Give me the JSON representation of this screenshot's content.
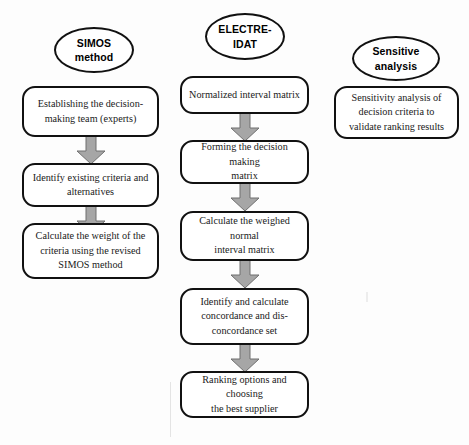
{
  "diagram": {
    "background_color": "#fdfdfd",
    "outline_color": "#111111",
    "arrow_fill_color": "#a6a6a6",
    "arrow_stroke_color": "#6f6f6f",
    "columns": [
      {
        "id": "simos",
        "header": {
          "name": "simos-method-ellipse",
          "line1": "SIMOS",
          "line2": "method"
        },
        "steps": [
          {
            "name": "establishing-team-box",
            "lines": [
              "Establishing the decision-",
              "making team (experts)"
            ]
          },
          {
            "name": "identify-criteria-box",
            "lines": [
              "Identify existing criteria and",
              "alternatives"
            ]
          },
          {
            "name": "calculate-weight-box",
            "lines": [
              "Calculate the weight of the",
              "criteria using the revised",
              "SIMOS method"
            ]
          }
        ]
      },
      {
        "id": "electre-idat",
        "header": {
          "name": "electre-idat-ellipse",
          "line1": "ELECTRE-",
          "line2": "IDAT"
        },
        "steps": [
          {
            "name": "normalized-interval-matrix-box",
            "lines": [
              "Normalized interval matrix"
            ]
          },
          {
            "name": "forming-decision-matrix-box",
            "lines": [
              "Forming the decision making",
              "matrix"
            ]
          },
          {
            "name": "weighed-normal-matrix-box",
            "lines": [
              "Calculate the weighed normal",
              "interval matrix"
            ]
          },
          {
            "name": "concordance-set-box",
            "lines": [
              "Identify and calculate",
              "concordance and dis-",
              "concordance set"
            ]
          },
          {
            "name": "ranking-options-box",
            "lines": [
              "Ranking options and choosing",
              "the best supplier"
            ]
          }
        ]
      },
      {
        "id": "sensitivity",
        "header": {
          "name": "sensitive-analysis-ellipse",
          "line1": "Sensitive",
          "line2": "analysis"
        },
        "steps": [
          {
            "name": "sensitivity-analysis-box",
            "lines": [
              "Sensitivity analysis of",
              "decision criteria to",
              "validate ranking results"
            ]
          }
        ]
      }
    ]
  }
}
